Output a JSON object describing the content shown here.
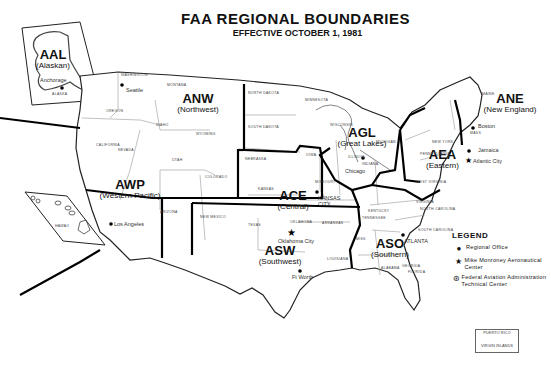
{
  "title": "FAA REGIONAL BOUNDARIES",
  "subtitle": "EFFECTIVE OCTOBER 1, 1981",
  "regions": [
    {
      "code": "AAL",
      "name": "(Alaskan)"
    },
    {
      "code": "ANW",
      "name": "(Northwest)"
    },
    {
      "code": "AWP",
      "name": "(Western Pacific)"
    },
    {
      "code": "ACE",
      "name": "(Central)"
    },
    {
      "code": "ASW",
      "name": "(Southwest)"
    },
    {
      "code": "AGL",
      "name": "(Great Lakes)"
    },
    {
      "code": "ASO",
      "name": "(Southern)"
    },
    {
      "code": "AEA",
      "name": "(Eastern)"
    },
    {
      "code": "ANE",
      "name": "(New England)"
    }
  ],
  "cities": {
    "anchorage": "Anchorage",
    "seattle": "Seattle",
    "los_angeles": "Los Angeles",
    "kansas_city": "KANSAS CITY",
    "oklahoma_city": "Oklahoma City",
    "fort_worth": "Ft Worth",
    "chicago": "Chicago",
    "atlanta": "ATLANTA",
    "jamaica": "Jamaica",
    "atlantic_city": "Atlantic City",
    "boston": "Boston"
  },
  "states": {
    "alaska": "ALASKA",
    "hawaii": "HAWAII",
    "washington": "WASHINGTON",
    "montana": "MONTANA",
    "oregon": "OREGON",
    "idaho": "IDAHO",
    "wyoming": "WYOMING",
    "california": "CALIFORNIA",
    "nevada": "NEVADA",
    "utah": "UTAH",
    "colorado": "COLORADO",
    "arizona": "ARIZONA",
    "new_mexico": "NEW MEXICO",
    "north_dakota": "NORTH DAKOTA",
    "south_dakota": "SOUTH DAKOTA",
    "nebraska": "NEBRASKA",
    "kansas": "KANSAS",
    "oklahoma": "OKLAHOMA",
    "texas": "TEXAS",
    "minnesota": "MINNESOTA",
    "iowa": "IOWA",
    "missouri": "MISSOURI",
    "arkansas": "ARKANSAS",
    "louisiana": "LOUISIANA",
    "wisconsin": "WISCONSIN",
    "illinois": "ILLINOIS",
    "indiana": "INDIANA",
    "ohio": "OHIO",
    "michigan": "MICHIGAN",
    "kentucky": "KENTUCKY",
    "tennessee": "TENNESSEE",
    "mississippi": "MISS",
    "alabama": "ALABAMA",
    "georgia": "GEORGIA",
    "florida": "FLORIDA",
    "south_carolina": "SOUTH CAROLINA",
    "north_carolina": "NORTH CAROLINA",
    "virginia": "VIRGINIA",
    "west_virginia": "WEST VIRGINIA",
    "pennsylvania": "PENNSYLVANIA",
    "new_york": "NEW YORK",
    "maine": "MAINE",
    "mass": "MASS"
  },
  "legend": {
    "title": "LEGEND",
    "items": [
      {
        "symbol": "●",
        "label": "Regional Office"
      },
      {
        "symbol": "★",
        "label": "Mike Monroney Aeronautical Center"
      },
      {
        "symbol": "⊛",
        "label": "Federal Aviation Administration Technical Center"
      }
    ]
  },
  "inset": {
    "puerto_rico": "PUERTO RICO",
    "virgin_islands": "VIRGIN ISLANDS"
  }
}
